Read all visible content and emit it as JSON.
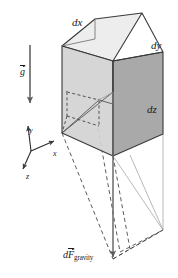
{
  "figure": {
    "background_color": "#ffffff"
  },
  "labels": {
    "dx": "dx",
    "dy": "dy",
    "dz": "dz",
    "axis_x": "x",
    "axis_y": "y",
    "axis_z": "z",
    "gravity_vector": "g",
    "force_symbol": "dF",
    "force_subscript": "gravity"
  },
  "colors": {
    "outline": "#3a3a3a",
    "top_face": "#ededed",
    "left_face": "#d2d2d2",
    "right_face": "#a9a9a9",
    "dashed_line": "#4a4a4a",
    "thin_line": "#8a8a8a",
    "arrow": "#5a5a5a",
    "text": "#1a1a1a"
  },
  "geometry": {
    "cube": {
      "top_face": "95,19 142,13 163,52 113,61",
      "left_face": "62,46 113,61 113,156 62,133",
      "right_face": "113,61 163,52 163,134 113,156"
    },
    "top_back_edges": "62,46 95,19 142,13",
    "hidden_back_vertical": "95,19 95,39",
    "inner_element": {
      "front_face": "65,118 98,128 98,100 67,92",
      "dashed_edges": "67,92 67,75 98,84 98,100"
    },
    "axes": {
      "origin": "31,151",
      "x_tip": "55,140",
      "y_tip": "27,124",
      "z_tip": "22,170"
    },
    "gravity_arrow": {
      "x": 30,
      "y_start": 45,
      "y_end": 105
    },
    "force_arrow": {
      "x": 113,
      "y_start": 92,
      "y_end": 259
    },
    "projection": {
      "apex": "113,259",
      "dashed_prism_corners": "62,133 113,156 163,134 163,208 113,259"
    }
  }
}
